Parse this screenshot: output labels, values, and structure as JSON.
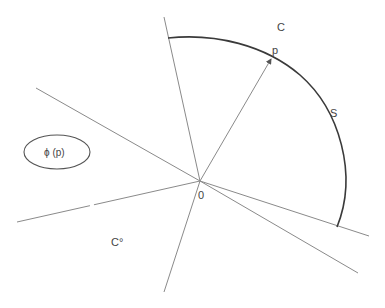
{
  "diagram": {
    "title": "",
    "colors": {
      "background": "#ffffff",
      "rays": "#8a8a8a",
      "arc": "#3a3a3a",
      "text": "#444444"
    },
    "origin": {
      "label": "0",
      "x": 200,
      "y": 181
    },
    "labels": {
      "cone": "C",
      "polar_cone": "C°",
      "point": "p",
      "arc": "S",
      "ellipse": "ϕ (p)",
      "origin": "0"
    },
    "rays": [
      {
        "name": "cone-boundary-upper",
        "x1": 164,
        "y1": 17,
        "x2": 200,
        "y2": 181
      },
      {
        "name": "cone-boundary-lower",
        "x1": 200,
        "y1": 181,
        "x2": 369,
        "y2": 236
      },
      {
        "name": "polar-boundary-left",
        "x1": 36,
        "y1": 88,
        "x2": 200,
        "y2": 181
      },
      {
        "name": "polar-boundary-right",
        "x1": 200,
        "y1": 181,
        "x2": 358,
        "y2": 273
      },
      {
        "name": "line-lower-left",
        "x1": 17,
        "y1": 222,
        "x2": 200,
        "y2": 181
      },
      {
        "name": "line-lower",
        "x1": 200,
        "y1": 181,
        "x2": 164,
        "y2": 292
      }
    ],
    "vector": {
      "name": "vector-p",
      "x1": 200,
      "y1": 181,
      "x2": 271,
      "y2": 59
    },
    "arc": {
      "name": "arc-S",
      "from": [
        168,
        38
      ],
      "to": [
        337,
        227
      ]
    },
    "ellipse": {
      "cx": 57,
      "cy": 152,
      "rx": 33,
      "ry": 17
    }
  }
}
